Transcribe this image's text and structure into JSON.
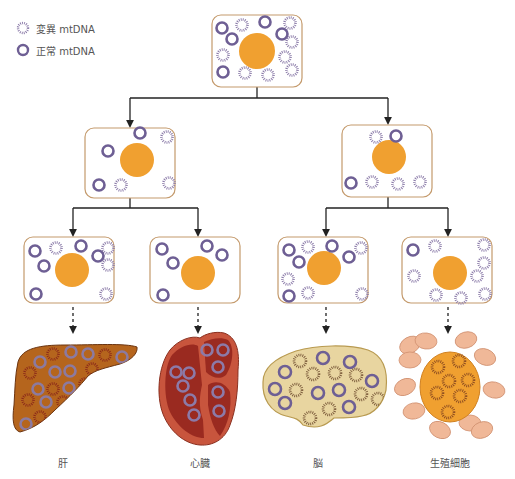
{
  "colors": {
    "normal_ring": "#6e5f94",
    "mutant_ring": "#8a7aa8",
    "cell_border": "#c49a6c",
    "nucleus": "#f0a030",
    "arrow": "#222222",
    "liver_fill": "#b5651d",
    "liver_stroke": "#6b3410",
    "liver_mutant": "#8b2a1a",
    "liver_normal": "#8c7aa0",
    "heart_outer": "#c8553d",
    "heart_inner": "#9a2a20",
    "heart_ring": "#8c7aa8",
    "brain_fill": "#e8d5a0",
    "brain_stroke": "#b89a50",
    "brain_mutant": "#7a5a3a",
    "germ_cell_fill": "#f0b898",
    "germ_cell_stroke": "#d09070",
    "egg_fill": "#f0a030",
    "egg_stroke": "#d08020",
    "egg_mutant": "#8a4a20"
  },
  "legend": [
    {
      "type": "mutant",
      "label": "変異 mtDNA"
    },
    {
      "type": "normal",
      "label": "正常 mtDNA"
    }
  ],
  "cells": [
    {
      "id": "root",
      "x": 212,
      "y": 15,
      "w": 90,
      "h": 72,
      "nucleus": {
        "cx": 257,
        "cy": 51,
        "r": 18
      },
      "mito": [
        [
          "n",
          222,
          28
        ],
        [
          "m",
          242,
          25
        ],
        [
          "n",
          265,
          22
        ],
        [
          "m",
          290,
          23
        ],
        [
          "n",
          232,
          39
        ],
        [
          "n",
          282,
          34
        ],
        [
          "m",
          292,
          42
        ],
        [
          "m",
          223,
          55
        ],
        [
          "m",
          285,
          57
        ],
        [
          "n",
          223,
          72
        ],
        [
          "m",
          245,
          73
        ],
        [
          "m",
          268,
          75
        ],
        [
          "m",
          292,
          70
        ]
      ]
    },
    {
      "id": "mid-left",
      "x": 85,
      "y": 128,
      "w": 90,
      "h": 70,
      "nucleus": {
        "cx": 137,
        "cy": 160,
        "r": 17
      },
      "mito": [
        [
          "n",
          140,
          133
        ],
        [
          "m",
          167,
          137
        ],
        [
          "n",
          108,
          151
        ],
        [
          "n",
          99,
          185
        ],
        [
          "m",
          121,
          185
        ],
        [
          "m",
          169,
          183
        ]
      ]
    },
    {
      "id": "mid-right",
      "x": 342,
      "y": 125,
      "w": 90,
      "h": 72,
      "nucleus": {
        "cx": 389,
        "cy": 157,
        "r": 17
      },
      "mito": [
        [
          "m",
          376,
          137
        ],
        [
          "n",
          396,
          136
        ],
        [
          "n",
          351,
          183
        ],
        [
          "m",
          372,
          182
        ],
        [
          "m",
          398,
          184
        ],
        [
          "m",
          420,
          182
        ]
      ]
    },
    {
      "id": "leaf-1",
      "x": 24,
      "y": 237,
      "w": 90,
      "h": 66,
      "nucleus": {
        "cx": 72,
        "cy": 270,
        "r": 17
      },
      "mito": [
        [
          "n",
          35,
          251
        ],
        [
          "m",
          56,
          248
        ],
        [
          "n",
          81,
          246
        ],
        [
          "m",
          108,
          248
        ],
        [
          "n",
          44,
          266
        ],
        [
          "n",
          98,
          256
        ],
        [
          "m",
          108,
          265
        ],
        [
          "n",
          36,
          294
        ],
        [
          "m",
          106,
          294
        ]
      ]
    },
    {
      "id": "leaf-2",
      "x": 150,
      "y": 237,
      "w": 90,
      "h": 66,
      "nucleus": {
        "cx": 198,
        "cy": 273,
        "r": 17
      },
      "mito": [
        [
          "n",
          162,
          249
        ],
        [
          "n",
          207,
          246
        ],
        [
          "n",
          222,
          255
        ],
        [
          "n",
          173,
          263
        ],
        [
          "n",
          163,
          295
        ]
      ]
    },
    {
      "id": "leaf-3",
      "x": 278,
      "y": 237,
      "w": 90,
      "h": 66,
      "nucleus": {
        "cx": 324,
        "cy": 268,
        "r": 17
      },
      "mito": [
        [
          "n",
          289,
          250
        ],
        [
          "m",
          308,
          247
        ],
        [
          "n",
          332,
          246
        ],
        [
          "m",
          361,
          248
        ],
        [
          "n",
          299,
          262
        ],
        [
          "n",
          349,
          257
        ],
        [
          "m",
          288,
          279
        ],
        [
          "n",
          289,
          296
        ],
        [
          "m",
          308,
          293
        ],
        [
          "m",
          362,
          294
        ]
      ]
    },
    {
      "id": "leaf-4",
      "x": 402,
      "y": 237,
      "w": 90,
      "h": 66,
      "nucleus": {
        "cx": 450,
        "cy": 273,
        "r": 17
      },
      "mito": [
        [
          "n",
          413,
          250
        ],
        [
          "m",
          435,
          246
        ],
        [
          "m",
          484,
          245
        ],
        [
          "m",
          484,
          263
        ],
        [
          "m",
          477,
          276
        ],
        [
          "m",
          414,
          276
        ],
        [
          "m",
          436,
          295
        ],
        [
          "m",
          461,
          298
        ],
        [
          "m",
          485,
          294
        ]
      ]
    }
  ],
  "connectors": {
    "solid": [
      {
        "from": [
          257,
          87
        ],
        "bar_y": 98,
        "to": [
          [
            130,
            128
          ],
          [
            388,
            125
          ]
        ]
      },
      {
        "from": [
          130,
          198
        ],
        "bar_y": 208,
        "to": [
          [
            73,
            237
          ],
          [
            198,
            237
          ]
        ]
      },
      {
        "from": [
          388,
          197
        ],
        "bar_y": 208,
        "to": [
          [
            326,
            237
          ],
          [
            448,
            237
          ]
        ]
      }
    ],
    "dashed": [
      [
        73,
        303,
        330
      ],
      [
        198,
        303,
        330
      ],
      [
        326,
        303,
        330
      ],
      [
        448,
        303,
        330
      ]
    ]
  },
  "organs": [
    {
      "id": "liver",
      "label": "肝",
      "label_x": 63
    },
    {
      "id": "heart",
      "label": "心臓",
      "label_x": 200
    },
    {
      "id": "brain",
      "label": "脳",
      "label_x": 318
    },
    {
      "id": "germ",
      "label": "生殖細胞",
      "label_x": 450
    }
  ],
  "liver_mito": [
    [
      "n",
      40,
      362
    ],
    [
      "m",
      53,
      354
    ],
    [
      "n",
      71,
      352
    ],
    [
      "n",
      88,
      354
    ],
    [
      "m",
      105,
      355
    ],
    [
      "n",
      122,
      357
    ],
    [
      "m",
      30,
      373
    ],
    [
      "n",
      55,
      372
    ],
    [
      "n",
      70,
      371
    ],
    [
      "m",
      92,
      369
    ],
    [
      "n",
      107,
      375
    ],
    [
      "n",
      38,
      389
    ],
    [
      "m",
      53,
      389
    ],
    [
      "n",
      69,
      388
    ],
    [
      "m",
      85,
      384
    ],
    [
      "m",
      28,
      400
    ],
    [
      "n",
      46,
      402
    ],
    [
      "m",
      63,
      402
    ],
    [
      "m",
      40,
      417
    ],
    [
      "n",
      26,
      424
    ]
  ],
  "heart_mito": [
    [
      176,
      372
    ],
    [
      189,
      373
    ],
    [
      183,
      386
    ],
    [
      190,
      400
    ],
    [
      194,
      415
    ],
    [
      207,
      350
    ],
    [
      223,
      350
    ],
    [
      218,
      367
    ],
    [
      218,
      392
    ],
    [
      219,
      411
    ]
  ],
  "brain_mito": [
    [
      "m",
      300,
      361
    ],
    [
      "n",
      323,
      358
    ],
    [
      "n",
      350,
      362
    ],
    [
      "n",
      285,
      372
    ],
    [
      "m",
      313,
      374
    ],
    [
      "m",
      335,
      373
    ],
    [
      "m",
      356,
      375
    ],
    [
      "n",
      372,
      381
    ],
    [
      "n",
      275,
      389
    ],
    [
      "m",
      296,
      390
    ],
    [
      "n",
      318,
      393
    ],
    [
      "n",
      339,
      390
    ],
    [
      "m",
      361,
      394
    ],
    [
      "m",
      378,
      399
    ],
    [
      "n",
      285,
      403
    ],
    [
      "m",
      329,
      409
    ],
    [
      "n",
      349,
      407
    ],
    [
      "m",
      310,
      418
    ]
  ],
  "germ_cells": [
    [
      410,
      345
    ],
    [
      426,
      341
    ],
    [
      466,
      340
    ],
    [
      485,
      357
    ],
    [
      410,
      360
    ],
    [
      405,
      387
    ],
    [
      494,
      390
    ],
    [
      414,
      411
    ],
    [
      440,
      430
    ],
    [
      470,
      423
    ],
    [
      482,
      430
    ]
  ],
  "egg_mito": [
    [
      438,
      367
    ],
    [
      459,
      361
    ],
    [
      449,
      381
    ],
    [
      468,
      380
    ],
    [
      437,
      393
    ],
    [
      460,
      396
    ],
    [
      448,
      412
    ]
  ]
}
